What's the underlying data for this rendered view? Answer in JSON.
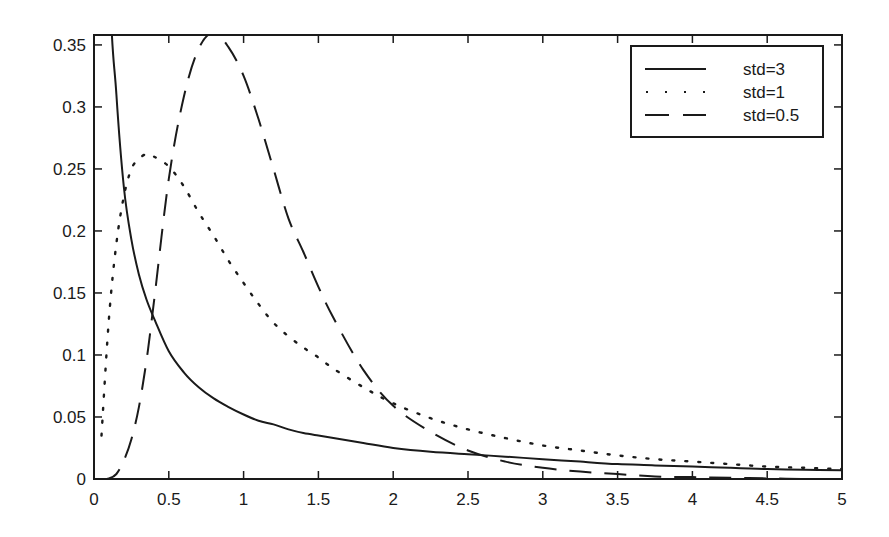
{
  "chart_data": {
    "type": "line",
    "title": "",
    "xlabel": "",
    "ylabel": "",
    "xlim": [
      0,
      5
    ],
    "ylim": [
      0,
      0.358
    ],
    "grid": false,
    "legend_position": "upper right",
    "x_ticks": [
      0,
      0.5,
      1,
      1.5,
      2,
      2.5,
      3,
      3.5,
      4,
      4.5,
      5
    ],
    "x_tick_labels": [
      "0",
      "0.5",
      "1",
      "1.5",
      "2",
      "2.5",
      "3",
      "3.5",
      "4",
      "4.5",
      "5"
    ],
    "y_ticks": [
      0,
      0.05,
      0.1,
      0.15,
      0.2,
      0.25,
      0.3,
      0.35
    ],
    "y_tick_labels": [
      "0",
      "0.05",
      "0.1",
      "0.15",
      "0.2",
      "0.25",
      "0.3",
      "0.35"
    ],
    "x": [
      0.05,
      0.1,
      0.15,
      0.2,
      0.25,
      0.3,
      0.35,
      0.4,
      0.5,
      0.6,
      0.7,
      0.8,
      0.9,
      1.0,
      1.1,
      1.2,
      1.3,
      1.4,
      1.5,
      1.6,
      1.8,
      2.0,
      2.25,
      2.5,
      2.75,
      3.0,
      3.25,
      3.5,
      3.75,
      4.0,
      4.25,
      4.5,
      4.75,
      5.0
    ],
    "series": [
      {
        "name": "std=3",
        "line_style": "solid",
        "values": [
          0.8,
          0.42,
          0.31,
          0.235,
          0.193,
          0.165,
          0.145,
          0.13,
          0.103,
          0.086,
          0.074,
          0.065,
          0.058,
          0.052,
          0.047,
          0.044,
          0.04,
          0.037,
          0.035,
          0.033,
          0.029,
          0.025,
          0.022,
          0.02,
          0.018,
          0.016,
          0.014,
          0.012,
          0.011,
          0.01,
          0.009,
          0.008,
          0.0075,
          0.007
        ]
      },
      {
        "name": "std=1",
        "line_style": "dotted",
        "values": [
          0.035,
          0.13,
          0.19,
          0.228,
          0.25,
          0.258,
          0.262,
          0.26,
          0.252,
          0.236,
          0.215,
          0.196,
          0.176,
          0.158,
          0.141,
          0.126,
          0.115,
          0.106,
          0.098,
          0.089,
          0.074,
          0.061,
          0.049,
          0.04,
          0.033,
          0.027,
          0.023,
          0.019,
          0.016,
          0.014,
          0.012,
          0.01,
          0.009,
          0.008
        ]
      },
      {
        "name": "std=0.5",
        "line_style": "dashed",
        "values": [
          0,
          0.0005,
          0.004,
          0.015,
          0.032,
          0.058,
          0.095,
          0.142,
          0.242,
          0.308,
          0.347,
          0.36,
          0.348,
          0.325,
          0.29,
          0.25,
          0.21,
          0.183,
          0.155,
          0.13,
          0.088,
          0.059,
          0.038,
          0.023,
          0.014,
          0.009,
          0.006,
          0.004,
          0.002,
          0.0015,
          0.001,
          0.0005,
          0,
          0
        ]
      }
    ]
  },
  "legend": {
    "entries": [
      {
        "label": "std=3",
        "style": "solid"
      },
      {
        "label": "std=1",
        "style": "dotted"
      },
      {
        "label": "std=0.5",
        "style": "dashed"
      }
    ]
  },
  "colors": {
    "line": "#1a1a1a",
    "background": "#ffffff"
  }
}
